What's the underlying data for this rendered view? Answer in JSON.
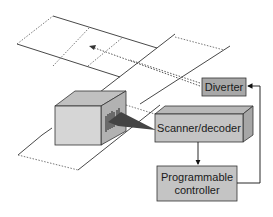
{
  "diagram": {
    "components": {
      "diverter": {
        "label": "Diverter",
        "fill": "#a8a8a8"
      },
      "scanner": {
        "label": "Scanner/decoder",
        "fill": "#c4c4c4"
      },
      "controller": {
        "label_line1": "Programmable",
        "label_line2": "controller",
        "fill": "#c4c4c4"
      },
      "package": {
        "fill_front": "#d6d6d6",
        "fill_top": "#c0c0c0",
        "fill_side": "#b2b2b2"
      }
    },
    "connections": [
      {
        "from": "Scanner/decoder",
        "to": "Programmable controller",
        "type": "arrow"
      },
      {
        "from": "Programmable controller",
        "to": "Diverter",
        "type": "arrow"
      },
      {
        "from": "Diverter",
        "to": "branch conveyor",
        "type": "dotted-arrow"
      }
    ],
    "colors": {
      "line": "#333333",
      "dashed": "#555555"
    }
  }
}
